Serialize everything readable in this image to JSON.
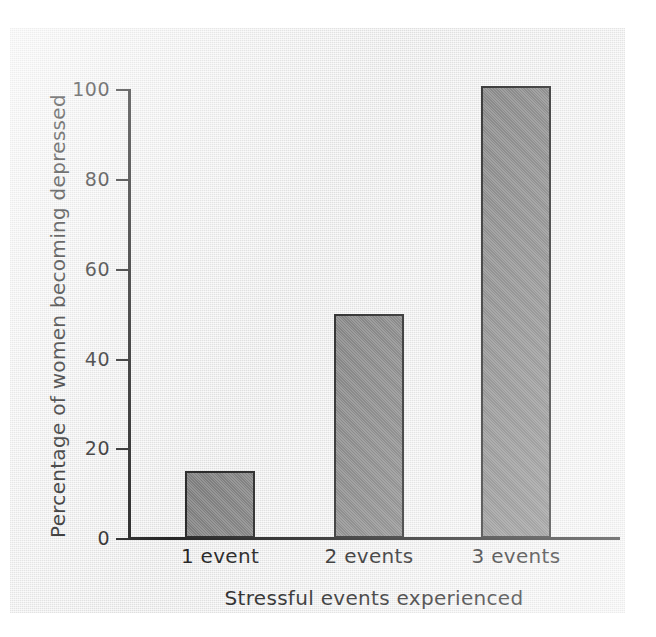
{
  "chart_data": {
    "type": "bar",
    "title": "",
    "xlabel": "Stressful events experienced",
    "ylabel": "Percentage of women becoming depressed",
    "categories": [
      "1 event",
      "2 events",
      "3 events"
    ],
    "values": [
      15,
      50,
      101
    ],
    "ylim": [
      0,
      105
    ],
    "yticks": [
      0,
      20,
      40,
      60,
      80,
      100
    ],
    "ytick_labels": [
      "0",
      "20",
      "40",
      "60",
      "80",
      "100"
    ],
    "grid": false,
    "legend": null,
    "bar_color": "#838383",
    "bar_edge_color": "#1f1f1f",
    "axis_color": "#1a1a1a",
    "background_color": "#ececec"
  },
  "axis": {
    "y_title": "Percentage of women becoming depressed",
    "x_title": "Stressful events experienced"
  }
}
